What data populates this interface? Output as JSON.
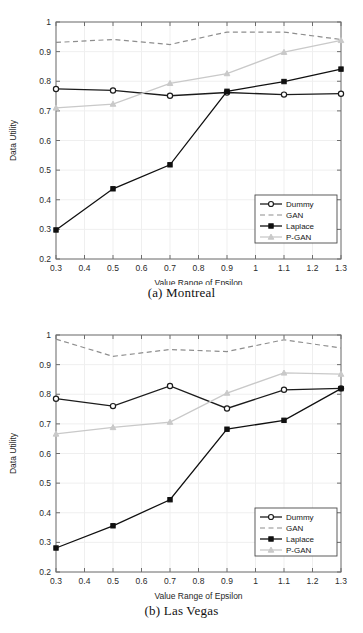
{
  "figure": {
    "panels": [
      {
        "caption": "(a) Montreal",
        "chart_data": {
          "type": "line",
          "title": "",
          "xlabel": "Value Range of Epsilon",
          "ylabel": "Data Utility",
          "xlim": [
            0.3,
            1.3
          ],
          "ylim": [
            0.2,
            1.0
          ],
          "xticks": [
            "0.3",
            "0.4",
            "0.5",
            "0.6",
            "0.7",
            "0.8",
            "0.9",
            "1",
            "1.1",
            "1.2",
            "1.3"
          ],
          "yticks": [
            "0.2",
            "0.3",
            "0.4",
            "0.5",
            "0.6",
            "0.7",
            "0.8",
            "0.9",
            "1"
          ],
          "grid": true,
          "legend_position": "lower-right",
          "x": [
            0.3,
            0.5,
            0.7,
            0.9,
            1.1,
            1.3
          ],
          "series": [
            {
              "name": "Dummy",
              "color": "#1c1c1c",
              "style": "solid",
              "marker": "circle-open",
              "values": [
                0.774,
                0.769,
                0.751,
                0.762,
                0.755,
                0.758
              ]
            },
            {
              "name": "GAN",
              "color": "#8e8e8e",
              "style": "dashed",
              "marker": "none",
              "values": [
                0.931,
                0.941,
                0.924,
                0.966,
                0.966,
                0.941
              ]
            },
            {
              "name": "Laplace",
              "color": "#101010",
              "style": "solid",
              "marker": "square-fill",
              "values": [
                0.298,
                0.437,
                0.518,
                0.766,
                0.799,
                0.841
              ]
            },
            {
              "name": "P-GAN",
              "color": "#c9c9c9",
              "style": "solid",
              "marker": "triangle",
              "values": [
                0.71,
                0.723,
                0.793,
                0.826,
                0.898,
                0.938
              ]
            }
          ]
        }
      },
      {
        "caption": "(b) Las Vegas",
        "chart_data": {
          "type": "line",
          "title": "",
          "xlabel": "Value Range of Epsilon",
          "ylabel": "Data Utility",
          "xlim": [
            0.3,
            1.3
          ],
          "ylim": [
            0.2,
            1.0
          ],
          "xticks": [
            "0.3",
            "0.4",
            "0.5",
            "0.6",
            "0.7",
            "0.8",
            "0.9",
            "1",
            "1.1",
            "1.2",
            "1.3"
          ],
          "yticks": [
            "0.2",
            "0.3",
            "0.4",
            "0.5",
            "0.6",
            "0.7",
            "0.8",
            "0.9",
            "1"
          ],
          "grid": true,
          "legend_position": "lower-right",
          "x": [
            0.3,
            0.5,
            0.7,
            0.9,
            1.1,
            1.3
          ],
          "series": [
            {
              "name": "Dummy",
              "color": "#1c1c1c",
              "style": "solid",
              "marker": "circle-open",
              "values": [
                0.785,
                0.76,
                0.828,
                0.752,
                0.815,
                0.82
              ]
            },
            {
              "name": "GAN",
              "color": "#8e8e8e",
              "style": "dashed",
              "marker": "none",
              "values": [
                0.986,
                0.928,
                0.951,
                0.944,
                0.984,
                0.956
              ]
            },
            {
              "name": "Laplace",
              "color": "#101010",
              "style": "solid",
              "marker": "square-fill",
              "values": [
                0.281,
                0.356,
                0.444,
                0.682,
                0.712,
                0.819
              ]
            },
            {
              "name": "P-GAN",
              "color": "#c9c9c9",
              "style": "solid",
              "marker": "triangle",
              "values": [
                0.666,
                0.688,
                0.706,
                0.804,
                0.872,
                0.868
              ]
            }
          ]
        }
      }
    ]
  }
}
